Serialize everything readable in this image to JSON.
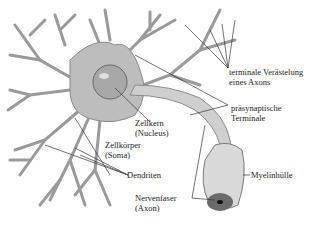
{
  "diagram": {
    "colors": {
      "background": "#ffffff",
      "cell": "#bdbdbd",
      "cell_dark": "#8a8a8a",
      "text": "#222222",
      "leader": "#333333"
    },
    "labels": [
      {
        "id": "terminal",
        "line1": "terminale Verästelung",
        "line2": "eines Axons"
      },
      {
        "id": "presyn",
        "line1": "präsynaptische",
        "line2": "Terminale"
      },
      {
        "id": "nucleus",
        "line1": "Zellkern",
        "line2": "(Nucleus)"
      },
      {
        "id": "soma",
        "line1": "Zellkörper",
        "line2": "(Soma)"
      },
      {
        "id": "dendrites",
        "line1": "Dendriten"
      },
      {
        "id": "myelin",
        "line1": "Myelinhülle"
      },
      {
        "id": "axon",
        "line1": "Nervenfaser",
        "line2": "(Axon)"
      }
    ]
  }
}
